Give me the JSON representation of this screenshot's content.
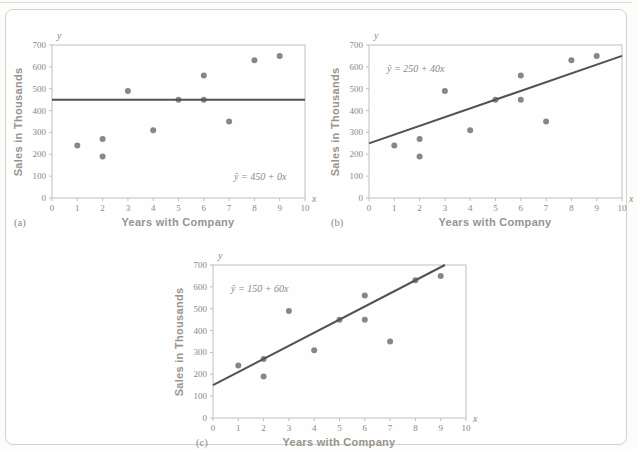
{
  "figure": {
    "border_color": "#d2d1ce",
    "frame_color": "#c2c0bc",
    "text_color": "#8c8883"
  },
  "chart_data": [
    {
      "type": "scatter",
      "label": "(a)",
      "equation": "ŷ = 450 + 0x",
      "regression": {
        "intercept": 450,
        "slope": 0
      },
      "x": [
        1,
        2,
        2,
        3,
        4,
        5,
        6,
        6,
        7,
        8,
        9
      ],
      "y": [
        240,
        270,
        190,
        490,
        310,
        450,
        560,
        450,
        350,
        630,
        650
      ],
      "xlabel": "Years with Company",
      "ylabel": "Sales in Thousands",
      "x_axis_letter": "x",
      "y_axis_letter": "y",
      "xlim": [
        0,
        10
      ],
      "ylim": [
        0,
        700
      ],
      "xticks": [
        0,
        1,
        2,
        3,
        4,
        5,
        6,
        7,
        8,
        9,
        10
      ],
      "yticks": [
        0,
        100,
        200,
        300,
        400,
        500,
        600,
        700
      ],
      "grid": false,
      "point_color": "#8a8783",
      "line_color": "#54514e"
    },
    {
      "type": "scatter",
      "label": "(b)",
      "equation": "ŷ = 250 + 40x",
      "regression": {
        "intercept": 250,
        "slope": 40
      },
      "x": [
        1,
        2,
        2,
        3,
        4,
        5,
        6,
        6,
        7,
        8,
        9
      ],
      "y": [
        240,
        270,
        190,
        490,
        310,
        450,
        560,
        450,
        350,
        630,
        650
      ],
      "xlabel": "Years with Company",
      "ylabel": "Sales in Thousands",
      "x_axis_letter": "x",
      "y_axis_letter": "y",
      "xlim": [
        0,
        10
      ],
      "ylim": [
        0,
        700
      ],
      "xticks": [
        0,
        1,
        2,
        3,
        4,
        5,
        6,
        7,
        8,
        9,
        10
      ],
      "yticks": [
        0,
        100,
        200,
        300,
        400,
        500,
        600,
        700
      ],
      "grid": false,
      "point_color": "#8a8783",
      "line_color": "#54514e"
    },
    {
      "type": "scatter",
      "label": "(c)",
      "equation": "ŷ = 150 + 60x",
      "regression": {
        "intercept": 150,
        "slope": 60
      },
      "x": [
        1,
        2,
        2,
        3,
        4,
        5,
        6,
        6,
        7,
        8,
        9
      ],
      "y": [
        240,
        270,
        190,
        490,
        310,
        450,
        560,
        450,
        350,
        630,
        650
      ],
      "xlabel": "Years with Company",
      "ylabel": "Sales in Thousands",
      "x_axis_letter": "x",
      "y_axis_letter": "y",
      "xlim": [
        0,
        10
      ],
      "ylim": [
        0,
        700
      ],
      "xticks": [
        0,
        1,
        2,
        3,
        4,
        5,
        6,
        7,
        8,
        9,
        10
      ],
      "yticks": [
        0,
        100,
        200,
        300,
        400,
        500,
        600,
        700
      ],
      "grid": false,
      "point_color": "#8a8783",
      "line_color": "#54514e"
    }
  ]
}
